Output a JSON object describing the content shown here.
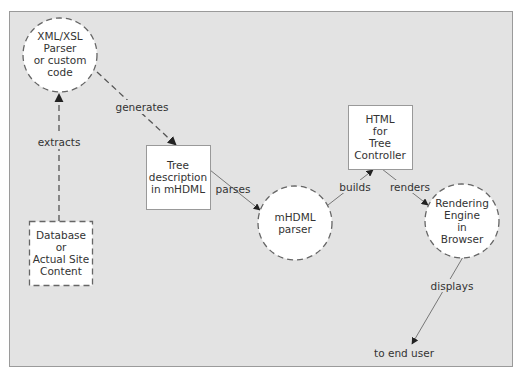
{
  "diagram": {
    "background": "#e3e3e3",
    "node_fill": "#ffffff",
    "stroke": "#777777",
    "nodes": {
      "xml_parser": {
        "shape": "circle-dashed",
        "lines": [
          "XML/XSL",
          "Parser",
          "or custom",
          "code"
        ]
      },
      "database": {
        "shape": "box-dashed",
        "lines": [
          "Database",
          "or",
          "Actual Site",
          "Content"
        ]
      },
      "tree_description": {
        "shape": "box",
        "lines": [
          "Tree",
          "description",
          "in mHDML"
        ]
      },
      "mhdml_parser": {
        "shape": "circle-dashed",
        "lines": [
          "mHDML",
          "parser"
        ]
      },
      "html_tree_controller": {
        "shape": "box",
        "lines": [
          "HTML",
          "for",
          "Tree",
          "Controller"
        ]
      },
      "rendering_engine": {
        "shape": "circle-dashed",
        "lines": [
          "Rendering",
          "Engine",
          "in",
          "Browser"
        ]
      },
      "end_user": {
        "shape": "text",
        "lines": [
          "to end user"
        ]
      }
    },
    "edges": {
      "extracts": {
        "from": "database",
        "to": "xml_parser",
        "label": "extracts",
        "style": "dashed"
      },
      "generates": {
        "from": "xml_parser",
        "to": "tree_description",
        "label": "generates",
        "style": "dashed"
      },
      "parses": {
        "from": "tree_description",
        "to": "mhdml_parser",
        "label": "parses",
        "style": "solid"
      },
      "builds": {
        "from": "mhdml_parser",
        "to": "html_tree_controller",
        "label": "builds",
        "style": "solid"
      },
      "renders": {
        "from": "html_tree_controller",
        "to": "rendering_engine",
        "label": "renders",
        "style": "solid"
      },
      "displays": {
        "from": "rendering_engine",
        "to": "end_user",
        "label": "displays",
        "style": "solid"
      }
    }
  }
}
